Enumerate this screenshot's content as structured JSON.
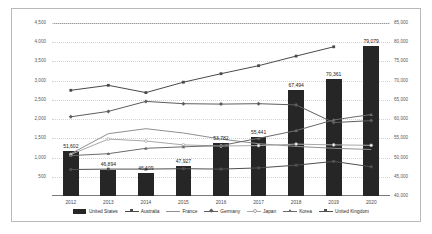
{
  "chart_data": {
    "type": "bar",
    "title": "",
    "subtitle": "",
    "xlabel": "",
    "ylabel": "",
    "categories": [
      "2012",
      "2013",
      "2014",
      "2015",
      "2016",
      "2017",
      "2018",
      "2019",
      "2020"
    ],
    "grid": true,
    "legend_position": "bottom",
    "axes": {
      "left": {
        "ylim": [
          0,
          4500
        ],
        "ticks": [
          "",
          "500",
          "1,000",
          "1,500",
          "2,000",
          "2,500",
          "3,000",
          "3,500",
          "4,000",
          "4,500"
        ],
        "tick_values": [
          0,
          500,
          1000,
          1500,
          2000,
          2500,
          3000,
          3500,
          4000,
          4500
        ]
      },
      "right": {
        "ylim": [
          40000,
          85000
        ],
        "ticks": [
          "40,000",
          "45,000",
          "50,000",
          "55,000",
          "60,000",
          "65,000",
          "70,000",
          "75,000",
          "80,000",
          "85,000"
        ],
        "tick_values": [
          40000,
          45000,
          50000,
          55000,
          60000,
          65000,
          70000,
          75000,
          80000,
          85000
        ]
      }
    },
    "series": [
      {
        "name": "United States",
        "type": "bar",
        "axis": "right",
        "color": "#262626",
        "values": [
          51602,
          46894,
          46109,
          47927,
          53782,
          55441,
          67494,
          70361,
          79079
        ],
        "data_labels": [
          "51,602",
          "46,894",
          "46,109",
          "47,927",
          "53,782",
          "55,441",
          "67,494",
          "70,361",
          "79,079"
        ]
      },
      {
        "name": "Australia",
        "type": "line",
        "axis": "left",
        "color": "#4a4a4a",
        "marker": "square",
        "values": [
          2750,
          2880,
          2690,
          2960,
          3180,
          3390,
          3640,
          3880,
          null
        ]
      },
      {
        "name": "France",
        "type": "line",
        "axis": "left",
        "color": "#8f8f8f",
        "marker": "none",
        "values": [
          1100,
          1620,
          1750,
          1640,
          1480,
          1360,
          1290,
          1240,
          1210
        ]
      },
      {
        "name": "Germany",
        "type": "line",
        "axis": "left",
        "color": "#5e5e5e",
        "marker": "diamond",
        "values": [
          2060,
          2200,
          2460,
          2400,
          2390,
          2400,
          2370,
          1910,
          1960
        ]
      },
      {
        "name": "Japan",
        "type": "line",
        "axis": "left",
        "color": "#a8a8a8",
        "marker": "circle-open",
        "values": [
          1080,
          1480,
          1430,
          1330,
          1300,
          1310,
          1350,
          1330,
          1320
        ]
      },
      {
        "name": "Korea",
        "type": "line",
        "axis": "left",
        "color": "#6b6b6b",
        "marker": "triangle",
        "values": [
          1050,
          1100,
          1240,
          1280,
          1310,
          1500,
          1700,
          1980,
          2120
        ]
      },
      {
        "name": "United Kingdom",
        "type": "line",
        "axis": "left",
        "color": "#4f4f4f",
        "marker": "square",
        "values": [
          690,
          700,
          700,
          710,
          700,
          730,
          800,
          900,
          760
        ]
      }
    ]
  },
  "legend": {
    "items": [
      {
        "label": "United States",
        "marker": "bar"
      },
      {
        "label": "Australia",
        "marker": "square"
      },
      {
        "label": "France",
        "marker": "plain-line"
      },
      {
        "label": "Germany",
        "marker": "diamond"
      },
      {
        "label": "Japan",
        "marker": "circle-open"
      },
      {
        "label": "Korea",
        "marker": "triangle"
      },
      {
        "label": "United Kingdom",
        "marker": "square"
      }
    ]
  }
}
